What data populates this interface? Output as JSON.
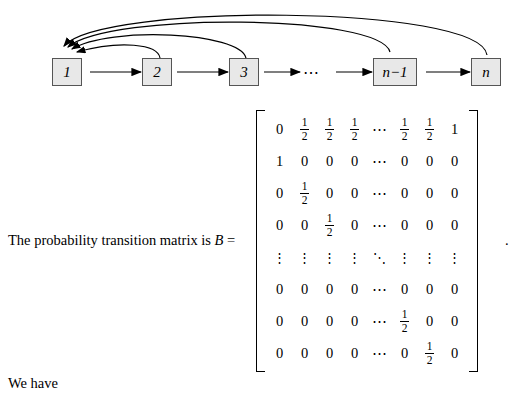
{
  "diagram": {
    "nodes": [
      {
        "label": "1"
      },
      {
        "label": "2"
      },
      {
        "label": "3"
      },
      {
        "label": "n−1"
      },
      {
        "label": "n"
      }
    ],
    "inline_dots": "⋯"
  },
  "text": {
    "sentence_before": "The probability transition matrix is",
    "matrix_symbol": "B",
    "equals": "=",
    "period": ".",
    "we_have": "We have"
  },
  "matrix": {
    "rows": [
      [
        "0",
        "1/2",
        "1/2",
        "1/2",
        "⋯",
        "1/2",
        "1/2",
        "1"
      ],
      [
        "1",
        "0",
        "0",
        "0",
        "⋯",
        "0",
        "0",
        "0"
      ],
      [
        "0",
        "1/2",
        "0",
        "0",
        "⋯",
        "0",
        "0",
        "0"
      ],
      [
        "0",
        "0",
        "1/2",
        "0",
        "⋯",
        "0",
        "0",
        "0"
      ],
      [
        "⋮",
        "⋮",
        "⋮",
        "⋮",
        "⋱",
        "⋮",
        "⋮",
        "⋮"
      ],
      [
        "0",
        "0",
        "0",
        "0",
        "⋯",
        "0",
        "0",
        "0"
      ],
      [
        "0",
        "0",
        "0",
        "0",
        "⋯",
        "1/2",
        "0",
        "0"
      ],
      [
        "0",
        "0",
        "0",
        "0",
        "⋯",
        "0",
        "1/2",
        "0"
      ]
    ]
  }
}
